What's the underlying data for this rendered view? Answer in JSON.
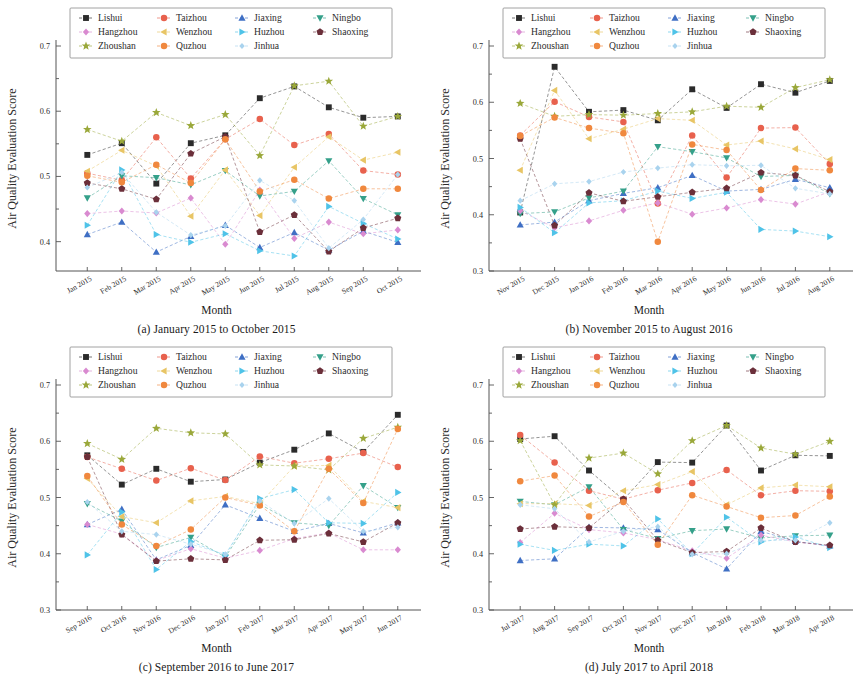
{
  "figure": {
    "axis_y_title": "Air Quality Evaluation Score",
    "axis_x_title": "Month"
  },
  "series_meta": [
    {
      "name": "Lishui",
      "color": "#2b2b2b",
      "marker": "square"
    },
    {
      "name": "Taizhou",
      "color": "#e8614d",
      "marker": "circle"
    },
    {
      "name": "Jiaxing",
      "color": "#3f6fc4",
      "marker": "triangle-up"
    },
    {
      "name": "Ningbo",
      "color": "#35a08a",
      "marker": "triangle-down"
    },
    {
      "name": "Hangzhou",
      "color": "#d98ad0",
      "marker": "diamond"
    },
    {
      "name": "Wenzhou",
      "color": "#e8c565",
      "marker": "triangle-left"
    },
    {
      "name": "Huzhou",
      "color": "#4fc3e8",
      "marker": "triangle-right"
    },
    {
      "name": "Shaoxing",
      "color": "#6b2f3a",
      "marker": "pentagon"
    },
    {
      "name": "Zhoushan",
      "color": "#9aa83a",
      "marker": "star"
    },
    {
      "name": "Quzhou",
      "color": "#f0883e",
      "marker": "hexagon"
    },
    {
      "name": "Jinhua",
      "color": "#a9d3ee",
      "marker": "diamond-small"
    }
  ],
  "chart_data": [
    {
      "panel": "a",
      "type": "line",
      "caption": "(a) January 2015 to October 2015",
      "title": "",
      "xlabel": "Month",
      "ylabel": "Air Quality Evaluation Score",
      "ylim": [
        0.355,
        0.7
      ],
      "yticks": [
        0.4,
        0.5,
        0.6,
        0.7
      ],
      "ytick_labels": [
        "0.4",
        "0.5",
        "0.6",
        "0.7"
      ],
      "grid": false,
      "legend_position": "top",
      "categories": [
        "Jan 2015",
        "Feb 2015",
        "Mar 2015",
        "Apr 2015",
        "May 2015",
        "Jun 2015",
        "Jul 2015",
        "Aug 2015",
        "Sep 2015",
        "Oct 2015"
      ],
      "series": [
        {
          "name": "Lishui",
          "values": [
            0.533,
            0.551,
            0.489,
            0.551,
            0.563,
            0.62,
            0.638,
            0.606,
            0.59,
            0.592
          ]
        },
        {
          "name": "Taizhou",
          "values": [
            0.505,
            0.494,
            0.56,
            0.497,
            0.557,
            0.588,
            0.548,
            0.565,
            0.509,
            0.503
          ]
        },
        {
          "name": "Jiaxing",
          "values": [
            0.411,
            0.43,
            0.384,
            0.408,
            0.425,
            0.391,
            0.414,
            0.387,
            0.416,
            0.399
          ]
        },
        {
          "name": "Ningbo",
          "values": [
            0.467,
            0.501,
            0.498,
            0.487,
            0.509,
            0.47,
            0.477,
            0.524,
            0.466,
            0.441
          ]
        },
        {
          "name": "Hangzhou",
          "values": [
            0.443,
            0.447,
            0.444,
            0.467,
            0.396,
            0.479,
            0.405,
            0.43,
            0.412,
            0.418
          ]
        },
        {
          "name": "Wenzhou",
          "values": [
            0.508,
            0.54,
            0.516,
            0.439,
            0.51,
            0.44,
            0.514,
            0.561,
            0.525,
            0.537
          ]
        },
        {
          "name": "Huzhou",
          "values": [
            0.425,
            0.51,
            0.411,
            0.399,
            0.412,
            0.386,
            0.378,
            0.454,
            0.428,
            0.404
          ]
        },
        {
          "name": "Shaoxing",
          "values": [
            0.49,
            0.481,
            0.465,
            0.535,
            0.561,
            0.415,
            0.441,
            0.385,
            0.421,
            0.436
          ]
        },
        {
          "name": "Zhoushan",
          "values": [
            0.572,
            0.554,
            0.598,
            0.578,
            0.595,
            0.532,
            0.639,
            0.646,
            0.577,
            0.592
          ]
        },
        {
          "name": "Quzhou",
          "values": [
            0.501,
            0.491,
            0.518,
            0.49,
            0.557,
            0.477,
            0.495,
            0.466,
            0.481,
            0.481
          ]
        },
        {
          "name": "Jinhua",
          "values": [
            0.483,
            0.506,
            0.445,
            0.41,
            0.424,
            0.494,
            0.463,
            0.39,
            0.434,
            0.503
          ]
        }
      ]
    },
    {
      "panel": "b",
      "type": "line",
      "caption": "(b) November 2015 to August 2016",
      "title": "",
      "xlabel": "Month",
      "ylabel": "Air Quality Evaluation Score",
      "ylim": [
        0.3,
        0.7
      ],
      "yticks": [
        0.3,
        0.4,
        0.5,
        0.6,
        0.7
      ],
      "ytick_labels": [
        "0.3",
        "0.4",
        "0.5",
        "0.6",
        "0.7"
      ],
      "grid": false,
      "legend_position": "top",
      "categories": [
        "Nov 2015",
        "Dec 2015",
        "Jan 2016",
        "Feb 2016",
        "Mar 2016",
        "Apr 2016",
        "May 2016",
        "Jun 2016",
        "Jul 2016",
        "Aug 2016"
      ],
      "series": [
        {
          "name": "Lishui",
          "values": [
            0.404,
            0.663,
            0.583,
            0.586,
            0.568,
            0.623,
            0.59,
            0.632,
            0.617,
            0.638
          ]
        },
        {
          "name": "Taizhou",
          "values": [
            0.541,
            0.601,
            0.574,
            0.565,
            0.42,
            0.541,
            0.466,
            0.554,
            0.555,
            0.49
          ]
        },
        {
          "name": "Jiaxing",
          "values": [
            0.382,
            0.387,
            0.425,
            0.438,
            0.448,
            0.47,
            0.442,
            0.445,
            0.463,
            0.448
          ]
        },
        {
          "name": "Ningbo",
          "values": [
            0.402,
            0.405,
            0.43,
            0.442,
            0.521,
            0.512,
            0.501,
            0.468,
            0.47,
            0.437
          ]
        },
        {
          "name": "Hangzhou",
          "values": [
            0.407,
            0.377,
            0.389,
            0.408,
            0.421,
            0.401,
            0.412,
            0.427,
            0.419,
            0.441
          ]
        },
        {
          "name": "Wenzhou",
          "values": [
            0.479,
            0.621,
            0.535,
            0.552,
            0.571,
            0.568,
            0.524,
            0.531,
            0.517,
            0.498
          ]
        },
        {
          "name": "Huzhou",
          "values": [
            0.413,
            0.368,
            0.421,
            0.425,
            0.442,
            0.429,
            0.44,
            0.374,
            0.371,
            0.361
          ]
        },
        {
          "name": "Shaoxing",
          "values": [
            0.535,
            0.381,
            0.439,
            0.424,
            0.432,
            0.44,
            0.447,
            0.475,
            0.47,
            0.441
          ]
        },
        {
          "name": "Zhoushan",
          "values": [
            0.598,
            0.575,
            0.578,
            0.577,
            0.58,
            0.583,
            0.593,
            0.591,
            0.626,
            0.64
          ]
        },
        {
          "name": "Quzhou",
          "values": [
            0.54,
            0.573,
            0.554,
            0.545,
            0.352,
            0.525,
            0.515,
            0.444,
            0.482,
            0.479
          ]
        },
        {
          "name": "Jinhua",
          "values": [
            0.425,
            0.455,
            0.459,
            0.476,
            0.483,
            0.489,
            0.487,
            0.488,
            0.447,
            0.437
          ]
        }
      ]
    },
    {
      "panel": "c",
      "type": "line",
      "caption": "(c) September 2016 to June 2017",
      "title": "",
      "xlabel": "Month",
      "ylabel": "Air Quality Evaluation Score",
      "ylim": [
        0.3,
        0.7
      ],
      "yticks": [
        0.3,
        0.4,
        0.5,
        0.6,
        0.7
      ],
      "ytick_labels": [
        "0.3",
        "0.4",
        "0.5",
        "0.6",
        "0.7"
      ],
      "grid": false,
      "legend_position": "top",
      "categories": [
        "Sep 2016",
        "Oct 2016",
        "Nov 2016",
        "Dec 2016",
        "Jan 2017",
        "Feb 2017",
        "Mar 2017",
        "Apr 2017",
        "May 2017",
        "Jun 2017"
      ],
      "series": [
        {
          "name": "Lishui",
          "values": [
            0.575,
            0.523,
            0.551,
            0.528,
            0.532,
            0.562,
            0.585,
            0.614,
            0.581,
            0.647
          ]
        },
        {
          "name": "Taizhou",
          "values": [
            0.572,
            0.551,
            0.53,
            0.552,
            0.531,
            0.573,
            0.561,
            0.569,
            0.579,
            0.554
          ]
        },
        {
          "name": "Jiaxing",
          "values": [
            0.452,
            0.479,
            0.389,
            0.415,
            0.487,
            0.463,
            0.44,
            0.454,
            0.437,
            0.455
          ]
        },
        {
          "name": "Ningbo",
          "values": [
            0.489,
            0.458,
            0.411,
            0.429,
            0.394,
            0.488,
            0.455,
            0.45,
            0.521,
            0.482
          ]
        },
        {
          "name": "Hangzhou",
          "values": [
            0.452,
            0.435,
            0.388,
            0.409,
            0.392,
            0.406,
            0.427,
            0.437,
            0.407,
            0.407
          ]
        },
        {
          "name": "Wenzhou",
          "values": [
            0.534,
            0.466,
            0.455,
            0.494,
            0.502,
            0.489,
            0.556,
            0.557,
            0.493,
            0.482
          ]
        },
        {
          "name": "Huzhou",
          "values": [
            0.398,
            0.474,
            0.372,
            0.422,
            0.397,
            0.498,
            0.514,
            0.455,
            0.454,
            0.509
          ]
        },
        {
          "name": "Shaoxing",
          "values": [
            0.572,
            0.434,
            0.387,
            0.391,
            0.389,
            0.424,
            0.425,
            0.436,
            0.421,
            0.455
          ]
        },
        {
          "name": "Zhoushan",
          "values": [
            0.596,
            0.568,
            0.623,
            0.615,
            0.613,
            0.558,
            0.556,
            0.549,
            0.605,
            0.625
          ]
        },
        {
          "name": "Quzhou",
          "values": [
            0.538,
            0.452,
            0.414,
            0.443,
            0.5,
            0.486,
            0.44,
            0.551,
            0.49,
            0.622
          ]
        },
        {
          "name": "Jinhua",
          "values": [
            0.492,
            0.44,
            0.434,
            0.417,
            0.399,
            0.494,
            0.454,
            0.498,
            0.44,
            0.447
          ]
        }
      ]
    },
    {
      "panel": "d",
      "type": "line",
      "caption": "(d) July 2017 to April 2018",
      "title": "",
      "xlabel": "Month",
      "ylabel": "Air Quality Evaluation Score",
      "ylim": [
        0.3,
        0.7
      ],
      "yticks": [
        0.3,
        0.4,
        0.5,
        0.6,
        0.7
      ],
      "ytick_labels": [
        "0.3",
        "0.4",
        "0.5",
        "0.6",
        "0.7"
      ],
      "grid": false,
      "legend_position": "top",
      "categories": [
        "Jul 2017",
        "Aug 2017",
        "Sep 2017",
        "Oct 2017",
        "Nov 2017",
        "Dec 2017",
        "Jan 2018",
        "Feb 2018",
        "Mar 2018",
        "Apr 2018"
      ],
      "series": [
        {
          "name": "Lishui",
          "values": [
            0.604,
            0.609,
            0.548,
            0.496,
            0.563,
            0.562,
            0.628,
            0.548,
            0.575,
            0.574
          ]
        },
        {
          "name": "Taizhou",
          "values": [
            0.611,
            0.562,
            0.512,
            0.497,
            0.513,
            0.526,
            0.549,
            0.504,
            0.512,
            0.511
          ]
        },
        {
          "name": "Jiaxing",
          "values": [
            0.388,
            0.391,
            0.447,
            0.446,
            0.443,
            0.402,
            0.373,
            0.44,
            0.422,
            0.414
          ]
        },
        {
          "name": "Ningbo",
          "values": [
            0.493,
            0.487,
            0.519,
            0.443,
            0.427,
            0.441,
            0.444,
            0.428,
            0.432,
            0.433
          ]
        },
        {
          "name": "Hangzhou",
          "values": [
            0.42,
            0.472,
            0.443,
            0.437,
            0.425,
            0.405,
            0.392,
            0.433,
            0.421,
            0.414
          ]
        },
        {
          "name": "Wenzhou",
          "values": [
            0.489,
            0.489,
            0.486,
            0.512,
            0.523,
            0.546,
            0.487,
            0.517,
            0.522,
            0.519
          ]
        },
        {
          "name": "Huzhou",
          "values": [
            0.417,
            0.406,
            0.417,
            0.414,
            0.462,
            0.4,
            0.465,
            0.421,
            0.43,
            0.411
          ]
        },
        {
          "name": "Shaoxing",
          "values": [
            0.444,
            0.448,
            0.446,
            0.497,
            0.424,
            0.402,
            0.404,
            0.446,
            0.421,
            0.415
          ]
        },
        {
          "name": "Zhoushan",
          "values": [
            0.601,
            0.487,
            0.57,
            0.579,
            0.542,
            0.601,
            0.628,
            0.588,
            0.577,
            0.6
          ]
        },
        {
          "name": "Quzhou",
          "values": [
            0.529,
            0.539,
            0.466,
            0.492,
            0.416,
            0.504,
            0.484,
            0.464,
            0.468,
            0.502
          ]
        },
        {
          "name": "Jinhua",
          "values": [
            0.487,
            0.48,
            0.421,
            0.44,
            0.448,
            0.399,
            0.4,
            0.424,
            0.424,
            0.455
          ]
        }
      ]
    }
  ]
}
